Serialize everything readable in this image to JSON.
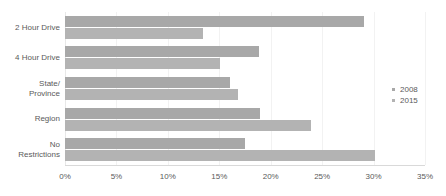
{
  "chart_data": {
    "type": "bar",
    "orientation": "horizontal",
    "title": "",
    "xlabel": "",
    "ylabel": "",
    "xlim": [
      0,
      35
    ],
    "grid": true,
    "legend_position": "right",
    "categories": [
      "2 Hour Drive",
      "4 Hour Drive",
      "State/\nProvince",
      "Region",
      "No\nRestrictions"
    ],
    "category_lines": [
      [
        "2 Hour Drive"
      ],
      [
        "4 Hour Drive"
      ],
      [
        "State/",
        "Province"
      ],
      [
        "Region"
      ],
      [
        "No",
        "Restrictions"
      ]
    ],
    "series": [
      {
        "name": "2008",
        "color": "#a8a8a8",
        "values": [
          29.1,
          18.9,
          16.0,
          19.0,
          17.5
        ]
      },
      {
        "name": "2015",
        "color": "#b3b3b3",
        "values": [
          13.4,
          15.1,
          16.8,
          23.9,
          30.1
        ]
      }
    ],
    "tick_labels": [
      "0%",
      "5%",
      "10%",
      "15%",
      "20%",
      "25%",
      "30%",
      "35%"
    ],
    "tick_values": [
      0,
      5,
      10,
      15,
      20,
      25,
      30,
      35
    ]
  },
  "legend": {
    "items": [
      {
        "label": "2008",
        "color": "#a8a8a8"
      },
      {
        "label": "2015",
        "color": "#b3b3b3"
      }
    ]
  }
}
